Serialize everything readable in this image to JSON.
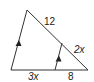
{
  "diagram": {
    "type": "triangle-with-parallel-segment",
    "colors": {
      "stroke": "#333333",
      "text": "#222222",
      "background": "#ffffff"
    },
    "labels": {
      "upper_left_side": "12",
      "upper_right_side_lower": "2x",
      "base_left": "3x",
      "base_right": "8"
    },
    "parallel_markers": [
      "arrow-left-side",
      "arrow-inner-segment"
    ]
  }
}
